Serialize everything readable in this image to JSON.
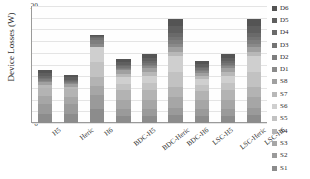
{
  "chart_data": {
    "type": "bar",
    "stacked": true,
    "title": "",
    "xlabel": "",
    "ylabel": "Device Losses (W)",
    "ylim": [
      0,
      20
    ],
    "ytick_labels": [
      "20",
      "18",
      "16",
      "14",
      "12",
      "10",
      "8",
      "6",
      "4",
      "2",
      "0"
    ],
    "ytick_values": [
      20,
      18,
      16,
      14,
      12,
      10,
      8,
      6,
      4,
      2,
      0
    ],
    "grid": true,
    "legend_position": "right",
    "categories": [
      "H5",
      "Heric",
      "H6",
      "BDC-H5",
      "BDC-Heric",
      "BDC-H6",
      "LSC-H5",
      "LSC-Heric",
      "LSC-H6"
    ],
    "series": [
      {
        "name": "S1",
        "color": "#8c8c8c",
        "values": [
          1.6,
          1.6,
          2.4,
          1.2,
          1.2,
          1.3,
          1.2,
          1.2,
          1.3
        ]
      },
      {
        "name": "S2",
        "color": "#9a9a9a",
        "values": [
          1.6,
          1.6,
          2.4,
          1.2,
          1.2,
          1.3,
          1.2,
          1.2,
          1.3
        ]
      },
      {
        "name": "S3",
        "color": "#a6a6a6",
        "values": [
          1.4,
          1.3,
          1.5,
          1.6,
          1.6,
          1.8,
          1.5,
          1.6,
          1.8
        ]
      },
      {
        "name": "S4",
        "color": "#b3b3b3",
        "values": [
          1.4,
          1.3,
          1.5,
          1.6,
          1.6,
          1.8,
          1.5,
          1.6,
          1.8
        ]
      },
      {
        "name": "S5",
        "color": "#c2c2c2",
        "values": [
          0.0,
          0.0,
          2.6,
          1.1,
          1.2,
          2.6,
          1.1,
          1.2,
          2.6
        ]
      },
      {
        "name": "S6",
        "color": "#cfcfcf",
        "values": [
          0.0,
          0.0,
          2.6,
          1.1,
          1.2,
          2.6,
          1.1,
          1.2,
          2.6
        ]
      },
      {
        "name": "S7",
        "color": "#b8b8b8",
        "values": [
          0.5,
          0.4,
          0.0,
          0.6,
          0.7,
          0.8,
          0.5,
          0.7,
          0.8
        ]
      },
      {
        "name": "S8",
        "color": "#a0a0a0",
        "values": [
          0.5,
          0.4,
          0.0,
          0.6,
          0.7,
          0.8,
          0.5,
          0.7,
          0.8
        ]
      },
      {
        "name": "D1",
        "color": "#8a8a8a",
        "values": [
          0.25,
          0.2,
          0.6,
          0.25,
          0.3,
          0.6,
          0.25,
          0.3,
          0.6
        ]
      },
      {
        "name": "D2",
        "color": "#7e7e7e",
        "values": [
          0.25,
          0.2,
          0.6,
          0.25,
          0.3,
          0.6,
          0.25,
          0.3,
          0.6
        ]
      },
      {
        "name": "D3",
        "color": "#747474",
        "values": [
          0.25,
          0.2,
          0.3,
          0.25,
          0.3,
          0.6,
          0.25,
          0.3,
          0.6
        ]
      },
      {
        "name": "D4",
        "color": "#6a6a6a",
        "values": [
          0.25,
          0.2,
          0.3,
          0.25,
          0.3,
          0.6,
          0.25,
          0.3,
          0.6
        ]
      },
      {
        "name": "D5",
        "color": "#5f5f5f",
        "values": [
          0.5,
          0.4,
          0.1,
          0.5,
          0.6,
          1.2,
          0.5,
          0.6,
          1.2
        ]
      },
      {
        "name": "D6",
        "color": "#545454",
        "values": [
          0.5,
          0.4,
          0.1,
          0.5,
          0.6,
          1.2,
          0.5,
          0.6,
          1.2
        ]
      }
    ],
    "totals": [
      9.0,
      8.2,
      15.0,
      11.0,
      11.7,
      17.8,
      10.55,
      11.7,
      17.8
    ],
    "legend_entries": [
      {
        "label": "D6",
        "color": "#545454"
      },
      {
        "label": "D5",
        "color": "#5f5f5f"
      },
      {
        "label": "D4",
        "color": "#6a6a6a"
      },
      {
        "label": "D3",
        "color": "#747474"
      },
      {
        "label": "D2",
        "color": "#7e7e7e"
      },
      {
        "label": "D1",
        "color": "#8a8a8a"
      },
      {
        "label": "S8",
        "color": "#a0a0a0"
      },
      {
        "label": "S7",
        "color": "#b8b8b8"
      },
      {
        "label": "S6",
        "color": "#cfcfcf"
      },
      {
        "label": "S5",
        "color": "#c2c2c2"
      },
      {
        "label": "S4",
        "color": "#b3b3b3"
      },
      {
        "label": "S3",
        "color": "#a6a6a6"
      },
      {
        "label": "S2",
        "color": "#9a9a9a"
      },
      {
        "label": "S1",
        "color": "#8c8c8c"
      }
    ]
  }
}
